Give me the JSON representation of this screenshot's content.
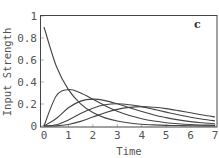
{
  "chart_data": {
    "type": "line",
    "title": "",
    "panel_label": "c",
    "xlabel": "Time",
    "ylabel": "Input Strength",
    "xlim": [
      0,
      7
    ],
    "ylim": [
      0,
      1
    ],
    "x_ticks": [
      "0",
      "1",
      "2",
      "3",
      "4",
      "5",
      "6",
      "7"
    ],
    "y_ticks": [
      "0",
      "0.2",
      "0.4",
      "0.6",
      "0.8",
      "1"
    ],
    "grid": false,
    "legend": null,
    "x": [
      0,
      0.5,
      1,
      1.5,
      2,
      2.5,
      3,
      3.5,
      4,
      4.5,
      5,
      5.5,
      6,
      6.5,
      7
    ],
    "series": [
      {
        "name": "curve-1",
        "values": [
          0.9,
          0.546,
          0.331,
          0.201,
          0.122,
          0.074,
          0.045,
          0.027,
          0.016,
          0.01,
          0.006,
          0.004,
          0.002,
          0.001,
          0.001
        ]
      },
      {
        "name": "curve-2",
        "values": [
          0.0,
          0.273,
          0.331,
          0.301,
          0.244,
          0.185,
          0.134,
          0.095,
          0.066,
          0.045,
          0.03,
          0.02,
          0.013,
          0.009,
          0.006
        ]
      },
      {
        "name": "curve-3",
        "values": [
          0.0,
          0.068,
          0.166,
          0.226,
          0.244,
          0.231,
          0.202,
          0.166,
          0.132,
          0.1,
          0.076,
          0.056,
          0.04,
          0.029,
          0.02
        ]
      },
      {
        "name": "curve-4",
        "values": [
          0.0,
          0.011,
          0.055,
          0.113,
          0.162,
          0.193,
          0.202,
          0.193,
          0.176,
          0.151,
          0.126,
          0.102,
          0.08,
          0.062,
          0.047
        ]
      },
      {
        "name": "curve-5",
        "values": [
          0.0,
          0.001,
          0.014,
          0.042,
          0.081,
          0.12,
          0.151,
          0.169,
          0.176,
          0.17,
          0.158,
          0.14,
          0.12,
          0.1,
          0.082
        ]
      }
    ]
  }
}
